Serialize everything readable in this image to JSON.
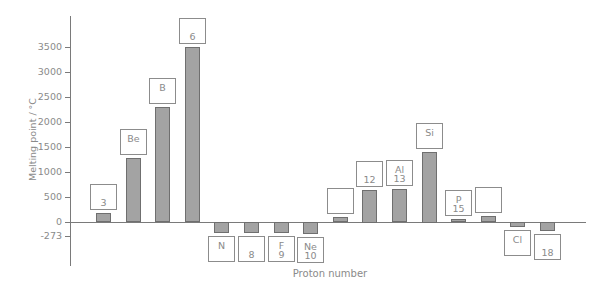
{
  "chart_data": {
    "type": "bar",
    "title": "",
    "xlabel": "Proton number",
    "ylabel": "Melting point / °C",
    "yticks": [
      "3500",
      "3000",
      "2500",
      "2000",
      "1500",
      "1000",
      "500",
      "0",
      "-273"
    ],
    "ytick_values": [
      3500,
      3000,
      2500,
      2000,
      1500,
      1000,
      500,
      0,
      -273
    ],
    "ylim": [
      -900,
      4100
    ],
    "categories": [
      "3",
      "4",
      "5",
      "6",
      "7",
      "8",
      "9",
      "10",
      "11",
      "12",
      "13",
      "14",
      "15",
      "16",
      "17",
      "18"
    ],
    "values": [
      180,
      1280,
      2300,
      3500,
      -210,
      -218,
      -220,
      -249,
      98,
      650,
      660,
      1410,
      44,
      115,
      -101,
      -189
    ],
    "label_boxes": [
      {
        "symbol": "",
        "number": "3"
      },
      {
        "symbol": "Be",
        "number": ""
      },
      {
        "symbol": "B",
        "number": ""
      },
      {
        "symbol": "",
        "number": "6"
      },
      {
        "symbol": "N",
        "number": ""
      },
      {
        "symbol": "",
        "number": "8"
      },
      {
        "symbol": "F",
        "number": "9"
      },
      {
        "symbol": "Ne",
        "number": "10"
      },
      {
        "symbol": "",
        "number": ""
      },
      {
        "symbol": "",
        "number": "12"
      },
      {
        "symbol": "Al",
        "number": "13"
      },
      {
        "symbol": "Si",
        "number": ""
      },
      {
        "symbol": "P",
        "number": "15"
      },
      {
        "symbol": "",
        "number": ""
      },
      {
        "symbol": "Cl",
        "number": ""
      },
      {
        "symbol": "",
        "number": "18"
      }
    ],
    "grid": false,
    "legend": null
  },
  "colors": {
    "bar_fill": "#a3a3a3",
    "bar_edge": "#6f6f6f",
    "axis": "#7a7a7a",
    "text": "#8a8a8a"
  }
}
